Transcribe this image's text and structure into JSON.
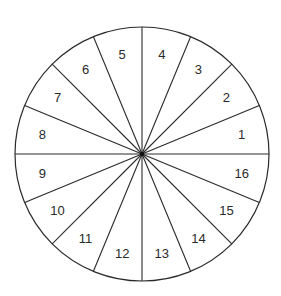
{
  "diagram": {
    "type": "segmented-circle",
    "segment_count": 16,
    "segment_angle_deg": 22.5,
    "numbering_direction": "counterclockwise",
    "first_segment_position": "right, just above horizontal",
    "line_color": "#2a2a2a",
    "background_color": "#ffffff",
    "segments": [
      {
        "label": "1"
      },
      {
        "label": "2"
      },
      {
        "label": "3"
      },
      {
        "label": "4"
      },
      {
        "label": "5"
      },
      {
        "label": "6"
      },
      {
        "label": "7"
      },
      {
        "label": "8"
      },
      {
        "label": "9"
      },
      {
        "label": "10"
      },
      {
        "label": "11"
      },
      {
        "label": "12"
      },
      {
        "label": "13"
      },
      {
        "label": "14"
      },
      {
        "label": "15"
      },
      {
        "label": "16"
      }
    ]
  }
}
